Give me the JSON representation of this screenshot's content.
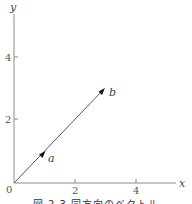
{
  "figure": {
    "type": "vector-diagram",
    "axes": {
      "x_label": "x",
      "y_label": "y",
      "origin_label": "0",
      "x_ticks": [
        {
          "value": 2,
          "label": "2"
        },
        {
          "value": 4,
          "label": "4"
        }
      ],
      "y_ticks": [
        {
          "value": 2,
          "label": "2"
        },
        {
          "value": 4,
          "label": "4"
        }
      ],
      "x_range": [
        0,
        5.2
      ],
      "y_range": [
        0,
        5.4
      ]
    },
    "vectors": [
      {
        "name": "a",
        "label": "a",
        "from": [
          0,
          0
        ],
        "to": [
          1,
          1
        ]
      },
      {
        "name": "b",
        "label": "b",
        "from": [
          0,
          0
        ],
        "to": [
          3,
          3
        ]
      }
    ],
    "colors": {
      "axis": "#8a8a8a",
      "vector": "#555555",
      "arrowhead": "#111111",
      "text": "#444444"
    }
  },
  "caption": {
    "text": "図 2.3  同方向のベクトル"
  }
}
